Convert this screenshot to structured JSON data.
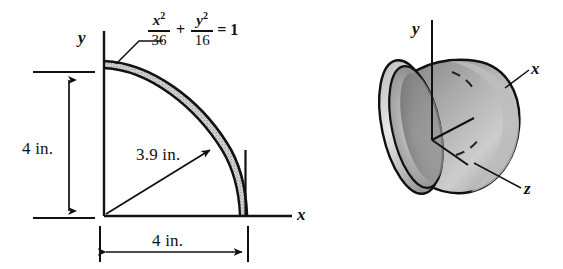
{
  "figure": {
    "background_color": "#ffffff",
    "line_color": "#111111",
    "shade_fill": "#c9c9c9"
  },
  "left_diagram": {
    "name": "cross-section-quadrant",
    "equation": {
      "term1_numerator": "x",
      "term1_numerator_exponent": "2",
      "term1_denominator": "36",
      "operator": "+",
      "term2_numerator": "y",
      "term2_numerator_exponent": "2",
      "term2_denominator": "16",
      "equals": "= 1",
      "full_text": "x^2/36 + y^2/16 = 1"
    },
    "axis_labels": {
      "y": "y",
      "x": "x"
    },
    "dimensions": [
      {
        "name": "vertical-height",
        "label": "4 in."
      },
      {
        "name": "horizontal-width",
        "label": "4 in."
      },
      {
        "name": "radial-distance",
        "label": "3.9 in."
      }
    ]
  },
  "right_diagram": {
    "name": "three-d-shell",
    "axis_labels": {
      "y": "y",
      "x": "x",
      "z": "z"
    }
  }
}
